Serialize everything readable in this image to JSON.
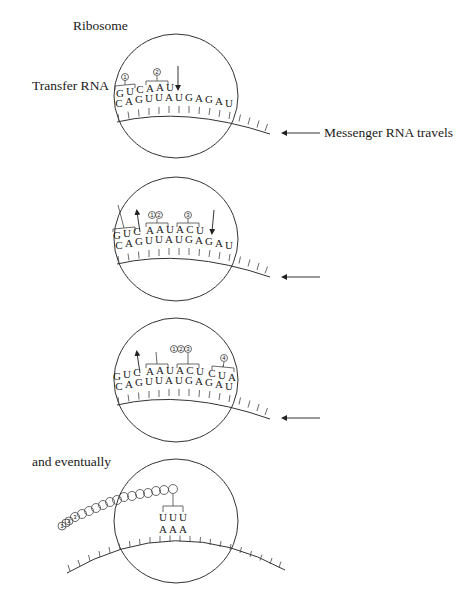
{
  "labels": {
    "ribosome": "Ribosome",
    "transfer_rna": "Transfer RNA",
    "messenger_rna_travels": "Messenger RNA travels",
    "and_eventually": "and eventually"
  },
  "panels": [
    {
      "trna_top": [
        "G",
        "U",
        "C",
        "A",
        "A",
        "U"
      ],
      "mrna_bottom": [
        "C",
        "A",
        "G",
        "U",
        "U",
        "A",
        "U",
        "G",
        "A",
        "G",
        "A",
        "U"
      ],
      "amino_acids": [
        "1",
        "2"
      ],
      "arrows": [
        "down"
      ]
    },
    {
      "trna_top": [
        "G",
        "U",
        "C",
        "A",
        "A",
        "U",
        "A",
        "C",
        "U"
      ],
      "mrna_bottom": [
        "C",
        "A",
        "G",
        "U",
        "U",
        "A",
        "U",
        "G",
        "A",
        "G",
        "A",
        "U"
      ],
      "amino_acids": [
        "1",
        "2",
        "3"
      ],
      "arrows": [
        "up-exit",
        "up",
        "down"
      ]
    },
    {
      "trna_top": [
        "G",
        "U",
        "C",
        "A",
        "A",
        "U",
        "A",
        "C",
        "U",
        "C",
        "U",
        "A"
      ],
      "mrna_bottom": [
        "C",
        "A",
        "G",
        "U",
        "U",
        "A",
        "U",
        "G",
        "A",
        "G",
        "A",
        "U"
      ],
      "amino_acids": [
        "1",
        "2",
        "3",
        "4"
      ],
      "arrows": [
        "up"
      ]
    },
    {
      "trna_top": [
        "U",
        "U",
        "U"
      ],
      "mrna_bottom": [
        "A",
        "A",
        "A"
      ],
      "chain_labels": [
        "1",
        "2",
        "3"
      ],
      "chain_length": 18
    }
  ],
  "numbers": {
    "n1": "1",
    "n2": "2",
    "n3": "3",
    "n4": "4"
  }
}
